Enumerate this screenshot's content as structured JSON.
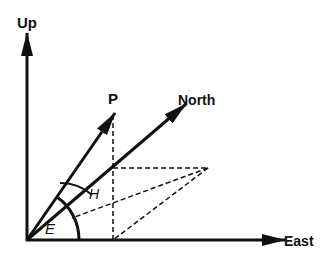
{
  "diagram": {
    "title": "",
    "labels": {
      "up": "Up",
      "east": "East",
      "north": "North",
      "point": "P",
      "elevation": "E",
      "azimuth": "H"
    },
    "colors": {
      "stroke": "#111111",
      "background": "#ffffff"
    }
  }
}
